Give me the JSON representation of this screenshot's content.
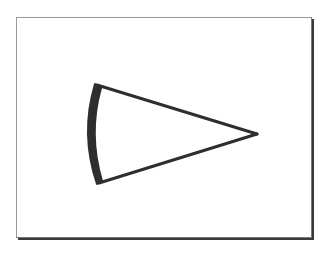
{
  "diagram": {
    "title": "",
    "shape": "cone-wedge",
    "frame": {
      "x": 16,
      "y": 17,
      "width": 294,
      "height": 219
    },
    "wedge": {
      "apex": [
        257,
        134
      ],
      "base_top": [
        95,
        84
      ],
      "base_bottom": [
        97,
        184
      ],
      "base_arc_leftmost_x": 84,
      "stroke_color": "#2e2e2e"
    }
  }
}
